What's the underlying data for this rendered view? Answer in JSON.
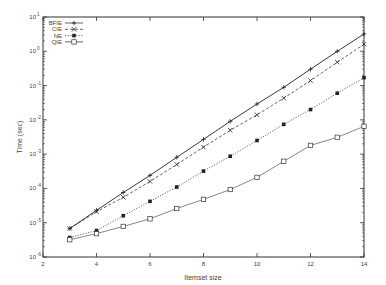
{
  "chart_data": {
    "type": "line",
    "title": "",
    "xlabel": "Itemset size",
    "ylabel": "Time (sec)",
    "xscale": "linear",
    "yscale": "log",
    "xlim": [
      2,
      14
    ],
    "ylim": [
      1e-06,
      10
    ],
    "xticks": [
      2,
      4,
      6,
      8,
      10,
      12,
      14
    ],
    "yticks": [
      {
        "exp": 1,
        "label": "10",
        "sup": "1"
      },
      {
        "exp": 0,
        "label": "10",
        "sup": "0"
      },
      {
        "exp": -1,
        "label": "10",
        "sup": "-1"
      },
      {
        "exp": -2,
        "label": "10",
        "sup": "-2"
      },
      {
        "exp": -3,
        "label": "10",
        "sup": "-3"
      },
      {
        "exp": -4,
        "label": "10",
        "sup": "-4"
      },
      {
        "exp": -5,
        "label": "10",
        "sup": "-5"
      },
      {
        "exp": -6,
        "label": "10",
        "sup": "-6"
      }
    ],
    "grid": false,
    "legend_position": "upper left",
    "x": [
      3,
      4,
      5,
      6,
      7,
      8,
      9,
      10,
      11,
      12,
      13,
      14
    ],
    "series": [
      {
        "name": "BFIE",
        "marker": "plus",
        "line": "solid",
        "values": [
          6.8e-06,
          2.3e-05,
          7.6e-05,
          0.00024,
          0.00081,
          0.0027,
          0.0091,
          0.029,
          0.089,
          0.3,
          1.0,
          3.2
        ]
      },
      {
        "name": "CIE",
        "marker": "cross",
        "line": "dashed",
        "values": [
          6.8e-06,
          2.1e-05,
          5.5e-05,
          0.00016,
          0.0005,
          0.0016,
          0.005,
          0.014,
          0.043,
          0.14,
          0.48,
          1.6
        ]
      },
      {
        "name": "NE",
        "marker": "filled-square",
        "line": "dotted",
        "values": [
          3.7e-06,
          5.9e-06,
          1.6e-05,
          4.2e-05,
          0.00011,
          0.00032,
          0.00087,
          0.0025,
          0.0074,
          0.02,
          0.06,
          0.17
        ]
      },
      {
        "name": "QIE",
        "marker": "open-square",
        "line": "solid-thin",
        "values": [
          3.2e-06,
          4.8e-06,
          7.8e-06,
          1.3e-05,
          2.6e-05,
          4.8e-05,
          9.3e-05,
          0.00021,
          0.00062,
          0.0018,
          0.0031,
          0.0065
        ]
      }
    ]
  }
}
